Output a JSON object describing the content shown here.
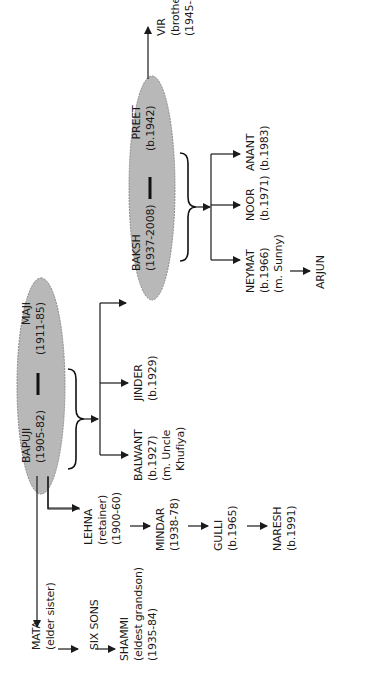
{
  "tree": {
    "orientation": "rotated-90-ccw",
    "couples": {
      "elders": {
        "partner1": {
          "name": "BAPUJI",
          "dates": "(1905-82)"
        },
        "partner2": {
          "name": "MAJI",
          "dates": "(1911-85)"
        }
      },
      "parents": {
        "partner1": {
          "name": "BAKSH",
          "dates": "(1937-2008)"
        },
        "partner2": {
          "name": "PREET",
          "dates": "(b.1942)"
        }
      }
    },
    "mata_line": {
      "mata": {
        "name": "MATA",
        "note": "(elder sister)"
      },
      "six_sons": {
        "name": "SIX SONS"
      },
      "shammi": {
        "name": "SHAMMI",
        "note": "(eldest grandson)",
        "dates": "(1935-84)"
      }
    },
    "lehna_line": {
      "lehna": {
        "name": "LEHNA",
        "note": "(retainer)",
        "dates": "(1900-60)"
      },
      "mindar": {
        "name": "MINDAR",
        "dates": "(1938-78)"
      },
      "gulli": {
        "name": "GULLI",
        "dates": "(b.1965)"
      },
      "naresh": {
        "name": "NARESH",
        "dates": "(b.1991)"
      }
    },
    "elders_children": {
      "balwant": {
        "name": "BALWANT",
        "dates": "(b.1927)",
        "note1": "(m. Uncle",
        "note2": "Khufiya)"
      },
      "jinder": {
        "name": "JINDER",
        "dates": "(b.1929)"
      }
    },
    "vir": {
      "name": "VIR",
      "note": "(brother)",
      "dates": "(1945-81)"
    },
    "parents_children": {
      "neymat": {
        "name": "NEYMAT",
        "dates": "(b.1966)",
        "note": "(m. Sunny)"
      },
      "noor": {
        "name": "NOOR",
        "dates": "(b.1971)"
      },
      "anant": {
        "name": "ANANT",
        "dates": "(b.1983)"
      }
    },
    "arjun": {
      "name": "ARJUN"
    }
  },
  "colors": {
    "ellipse_fill": "#b8b8b8",
    "ellipse_border": "#8a8a8a",
    "line": "#1a1a1a",
    "background": "#ffffff"
  }
}
